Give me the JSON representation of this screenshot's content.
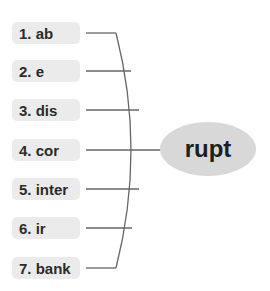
{
  "diagram": {
    "type": "word-formation-bracket",
    "prefixes": [
      {
        "number": "1.",
        "prefix": "ab",
        "label": "1. ab"
      },
      {
        "number": "2.",
        "prefix": "e",
        "label": "2. e"
      },
      {
        "number": "3.",
        "prefix": "dis",
        "label": "3. dis"
      },
      {
        "number": "4.",
        "prefix": "cor",
        "label": "4. cor"
      },
      {
        "number": "5.",
        "prefix": "inter",
        "label": "5. inter"
      },
      {
        "number": "6.",
        "prefix": "ir",
        "label": "6. ir"
      },
      {
        "number": "7.",
        "prefix": "bank",
        "label": "7. bank"
      }
    ],
    "root": {
      "label": "rupt"
    },
    "colors": {
      "label_bg": "#ebebeb",
      "root_bg": "#d8d8d8",
      "line": "#666666",
      "text": "#2b2b2b"
    }
  }
}
